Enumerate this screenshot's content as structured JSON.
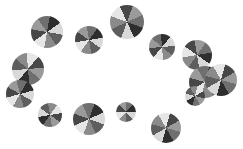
{
  "scene": {
    "width": 243,
    "height": 149,
    "background": "#ffffff",
    "description": "Grayscale segmented pie-wheel shapes scattered on white background",
    "wheels": [
      {
        "cx": 47,
        "cy": 32,
        "r": 16,
        "rot": 10
      },
      {
        "cx": 89,
        "cy": 40,
        "r": 14,
        "rot": 80
      },
      {
        "cx": 127,
        "cy": 22,
        "r": 17,
        "rot": 200
      },
      {
        "cx": 162,
        "cy": 47,
        "r": 13,
        "rot": 130
      },
      {
        "cx": 197,
        "cy": 55,
        "r": 15,
        "rot": 260
      },
      {
        "cx": 28,
        "cy": 69,
        "r": 16,
        "rot": 40
      },
      {
        "cx": 20,
        "cy": 94,
        "r": 14,
        "rot": 300
      },
      {
        "cx": 50,
        "cy": 115,
        "r": 12,
        "rot": 170
      },
      {
        "cx": 89,
        "cy": 119,
        "r": 16,
        "rot": 20
      },
      {
        "cx": 126,
        "cy": 112,
        "r": 10,
        "rot": 90
      },
      {
        "cx": 166,
        "cy": 128,
        "r": 15,
        "rot": 240
      },
      {
        "cx": 205,
        "cy": 82,
        "r": 16,
        "rot": 150
      },
      {
        "cx": 221,
        "cy": 80,
        "r": 16,
        "rot": 330
      },
      {
        "cx": 195,
        "cy": 96,
        "r": 10,
        "rot": 60
      }
    ],
    "palette": [
      "#2e2e2e",
      "#d8d8d8",
      "#5e5e5e",
      "#8a8a8a",
      "#e6e6e6",
      "#474747",
      "#9a9a9a",
      "#6f6f6f"
    ]
  }
}
